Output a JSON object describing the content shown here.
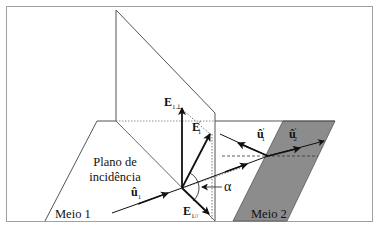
{
  "figure": {
    "colors": {
      "frame": "#9a9a9a",
      "line": "#444444",
      "arrow": "#111111",
      "medium2_fill": "#8c8c8c",
      "background": "#ffffff"
    }
  },
  "labels": {
    "plane_of_incidence_line1": "Plano de",
    "plane_of_incidence_line2": "incidência",
    "medium1": "Meio 1",
    "medium2": "Meio 2",
    "angle": "α",
    "e_perp": {
      "base": "E",
      "sub": "1⊥"
    },
    "e_total": {
      "base": "E",
      "sub": "1",
      "sup": "′"
    },
    "e_parallel": {
      "base": "E",
      "sub": "1//"
    },
    "u_incident": {
      "base": "û",
      "sub": "1"
    },
    "u_reflected": {
      "base": "û",
      "sub": "1",
      "sup": "′"
    },
    "u_transmitted": {
      "base": "û",
      "sub": "2",
      "sup": "′"
    }
  }
}
